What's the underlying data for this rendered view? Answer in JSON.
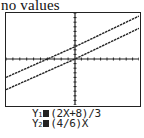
{
  "caption": "no values",
  "chart_data": {
    "type": "line",
    "title": "",
    "xlabel": "",
    "ylabel": "",
    "grid": false,
    "axes": {
      "tick_marks": true,
      "x_ticks_count": 20,
      "y_ticks_count": 20
    },
    "window": {
      "xmin": -10,
      "xmax": 10,
      "ymin": -10,
      "ymax": 10
    },
    "series": [
      {
        "name": "Y1",
        "equation": "(2X+8)/3",
        "slope": 0.6667,
        "intercept": 2.6667,
        "points": [
          [
            -10,
            -4
          ],
          [
            10,
            9.33
          ]
        ]
      },
      {
        "name": "Y2",
        "equation": "(4/6)X",
        "slope": 0.6667,
        "intercept": 0,
        "points": [
          [
            -10,
            -6.67
          ],
          [
            10,
            6.67
          ]
        ]
      }
    ],
    "legend": [
      "Y1=(2X+8)/3",
      "Y2=(4/6)X"
    ]
  },
  "equations": [
    {
      "label": "Y",
      "sub": "1",
      "expr": "(2X+8)/3"
    },
    {
      "label": "Y",
      "sub": "2",
      "expr": "(4/6)X"
    }
  ],
  "colors": {
    "ink": "#222222",
    "background": "#ffffff"
  }
}
